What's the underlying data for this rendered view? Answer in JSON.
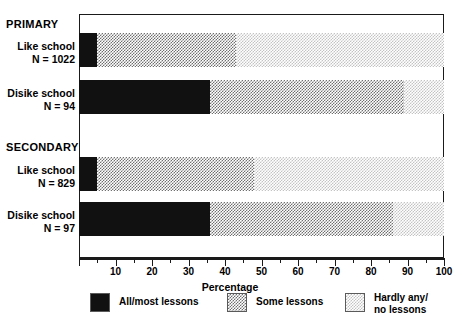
{
  "chart_data": {
    "type": "bar",
    "orientation": "horizontal",
    "stacked": true,
    "title": "",
    "xlabel": "Percentage",
    "ylabel": "",
    "xlim": [
      0,
      100
    ],
    "xticks": [
      0,
      10,
      20,
      30,
      40,
      50,
      60,
      70,
      80,
      90,
      100
    ],
    "xtick_labels": [
      "",
      "10",
      "20",
      "30",
      "40",
      "50",
      "60",
      "70",
      "80",
      "90",
      "100"
    ],
    "minor_tick_interval": 5,
    "grid": false,
    "legend_position": "bottom",
    "group_headers": [
      "PRIMARY",
      "SECONDARY"
    ],
    "categories": [
      "Like school\nN = 1022",
      "Disike school\nN = 94",
      "Like school\nN = 829",
      "Disike school\nN = 97"
    ],
    "series": [
      {
        "name": "All/most lessons",
        "values": [
          5,
          36,
          5,
          36
        ],
        "color": "#111111"
      },
      {
        "name": "Some lessons",
        "values": [
          38,
          53,
          43,
          50
        ],
        "color": "#6f6f6f"
      },
      {
        "name": "Hardly any/ no lessons",
        "values": [
          57,
          11,
          52,
          14
        ],
        "color": "#c3c3c3"
      }
    ]
  },
  "groups": [
    {
      "header": "PRIMARY"
    },
    {
      "header": "SECONDARY"
    }
  ],
  "rows": [
    {
      "name": "Like school",
      "n": "N = 1022"
    },
    {
      "name": "Disike school",
      "n": "N = 94"
    },
    {
      "name": "Like school",
      "n": "N = 829"
    },
    {
      "name": "Disike school",
      "n": "N = 97"
    }
  ],
  "axis": {
    "title": "Percentage",
    "labels": [
      "10",
      "20",
      "30",
      "40",
      "50",
      "60",
      "70",
      "80",
      "90",
      "100"
    ]
  },
  "legend": {
    "items": [
      {
        "label": "All/most lessons"
      },
      {
        "label": "Some lessons"
      },
      {
        "label": "Hardly any/\nno lessons"
      }
    ]
  }
}
